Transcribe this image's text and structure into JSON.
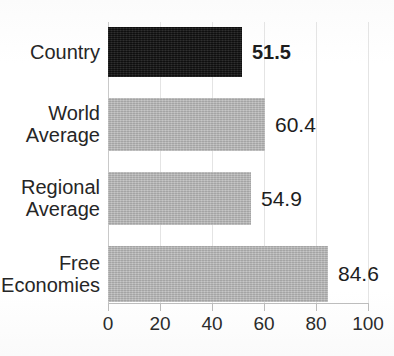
{
  "chart_data": {
    "type": "bar",
    "orientation": "horizontal",
    "title": "",
    "xlabel": "",
    "ylabel": "",
    "xlim": [
      0,
      100
    ],
    "xticks": [
      0,
      20,
      40,
      60,
      80,
      100
    ],
    "xtick_labels": [
      "0",
      "20",
      "40",
      "60",
      "80",
      "100"
    ],
    "grid": true,
    "grid_axis": "x",
    "legend": "none",
    "categories": [
      "Country",
      "World Average",
      "Regional Average",
      "Free Economies"
    ],
    "values": [
      51.5,
      60.4,
      54.9,
      84.6
    ],
    "value_labels": [
      "51.5",
      "60.4",
      "54.9",
      "84.6"
    ],
    "bar_colors": [
      "#1b1b1b",
      "#b4b4b4",
      "#b4b4b4",
      "#b4b4b4"
    ],
    "highlighted_category": "Country"
  },
  "axis": {
    "ticks": [
      {
        "label": "0",
        "value": 0
      },
      {
        "label": "20",
        "value": 20
      },
      {
        "label": "40",
        "value": 40
      },
      {
        "label": "60",
        "value": 60
      },
      {
        "label": "80",
        "value": 80
      },
      {
        "label": "100",
        "value": 100
      }
    ]
  },
  "rows": [
    {
      "category_line1": "Country",
      "category_line2": "",
      "value": 51.5,
      "value_label": "51.5",
      "highlighted": true
    },
    {
      "category_line1": "World",
      "category_line2": "Average",
      "value": 60.4,
      "value_label": "60.4",
      "highlighted": false
    },
    {
      "category_line1": "Regional",
      "category_line2": "Average",
      "value": 54.9,
      "value_label": "54.9",
      "highlighted": false
    },
    {
      "category_line1": "Free",
      "category_line2": "Economies",
      "value": 84.6,
      "value_label": "84.6",
      "highlighted": false
    }
  ],
  "colors": {
    "bar_gray": "#b4b4b4",
    "bar_dark": "#1b1b1b",
    "gridline": "#e4e4e4",
    "axis": "#bdbdbd",
    "text": "#1d1d1d",
    "background": "#ffffff"
  }
}
